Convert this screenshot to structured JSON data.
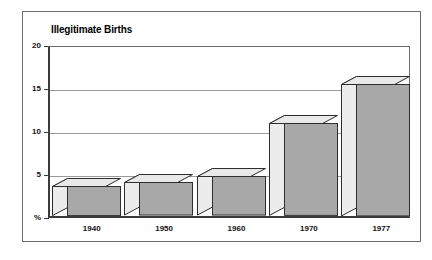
{
  "chart_data": {
    "type": "bar",
    "title": "Illegitimate Births",
    "xlabel": "",
    "ylabel": "%",
    "categories": [
      "1940",
      "1950",
      "1960",
      "1970",
      "1977"
    ],
    "values": [
      3.5,
      3.9,
      4.6,
      10.8,
      15.4
    ],
    "ylim": [
      0,
      20
    ],
    "yticks": [
      "%",
      "5",
      "10",
      "15",
      "20"
    ],
    "ytick_values": [
      0,
      5,
      10,
      15,
      20
    ],
    "grid": true,
    "legend": "none",
    "style": "3d-isometric-blocks",
    "colors": {
      "bar_front": "#a8a8a8",
      "bar_top": "#e9e9e9",
      "bar_side": "#ececec",
      "bar_outline": "#2e2e2e",
      "axis": "#3c3c3c",
      "gridline": "#9a9a9a",
      "frame": "#6d6d6d",
      "background": "#ffffff",
      "text": "#111111"
    }
  }
}
